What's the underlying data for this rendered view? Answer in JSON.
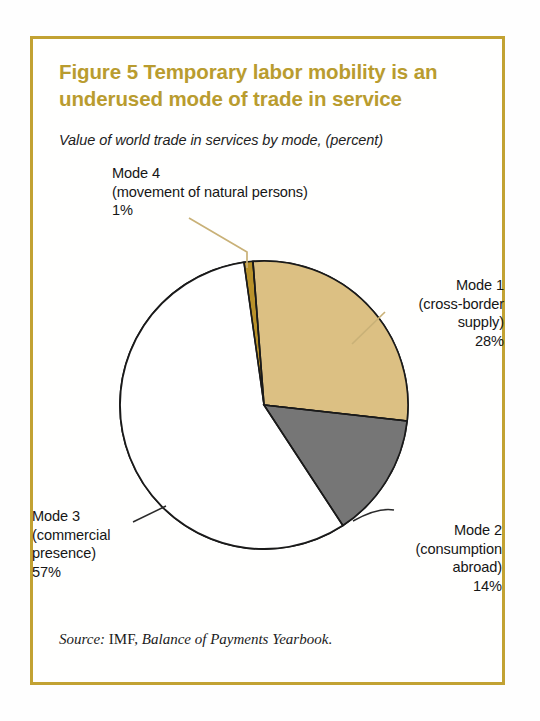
{
  "figure": {
    "title": "Figure 5  Temporary labor mobility is an underused mode of trade in service",
    "subtitle": "Value of world trade in services by mode, (percent)",
    "source_prefix": "Source:",
    "source_org": " IMF, ",
    "source_pub": "Balance of Payments Yearbook",
    "source_end": "."
  },
  "labels": {
    "mode4": "Mode 4\n(movement of natural persons)\n1%",
    "mode1": "Mode 1\n(cross-border\nsupply)\n28%",
    "mode2": "Mode 2\n(consumption\nabroad)\n14%",
    "mode3": "Mode 3\n(commercial\npresence)\n57%"
  },
  "colors": {
    "frame": "#c2a233",
    "title": "#b99c2f",
    "mode1": "#dcc083",
    "mode2": "#767676",
    "mode3": "#ffffff",
    "mode4": "#b8912a",
    "outline": "#1a1a1a",
    "leader_gold": "#c9b177",
    "leader_dark": "#2a2a2a"
  },
  "chart_data": {
    "type": "pie",
    "title": "Figure 5  Temporary labor mobility is an underused mode of trade in service",
    "subtitle": "Value of world trade in services by mode, (percent)",
    "unit": "percent",
    "start_angle_deg": -8,
    "direction": "clockwise",
    "categories": [
      "Mode 4 (movement of natural persons)",
      "Mode 1 (cross-border supply)",
      "Mode 2 (consumption abroad)",
      "Mode 3 (commercial presence)"
    ],
    "values": [
      1,
      28,
      14,
      57
    ],
    "slices": [
      {
        "name": "Mode 4",
        "detail": "(movement of natural persons)",
        "value": 1,
        "label": "1%",
        "color": "#b8912a"
      },
      {
        "name": "Mode 1",
        "detail": "(cross-border supply)",
        "value": 28,
        "label": "28%",
        "color": "#dcc083"
      },
      {
        "name": "Mode 2",
        "detail": "(consumption abroad)",
        "value": 14,
        "label": "14%",
        "color": "#767676"
      },
      {
        "name": "Mode 3",
        "detail": "(commercial presence)",
        "value": 57,
        "label": "57%",
        "color": "#ffffff"
      }
    ],
    "legend": "none",
    "grid": false,
    "total": 100
  }
}
